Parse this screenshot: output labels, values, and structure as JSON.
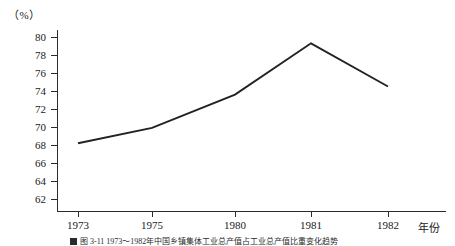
{
  "figure": {
    "unit_label": "（%）",
    "x_axis_name": "年份",
    "caption": "图 3-11  1973～1982年中国乡镇集体工业总产值占工业总产值比重变化趋势"
  },
  "chart_data": {
    "type": "line",
    "title": "",
    "subtitle": "",
    "xlabel": "年份",
    "ylabel": "（%）",
    "categories": [
      "1973",
      "1975",
      "1980",
      "1981",
      "1982"
    ],
    "values": [
      68.2,
      69.9,
      73.6,
      79.3,
      74.5
    ],
    "series": [
      {
        "name": "比重",
        "values": [
          68.2,
          69.9,
          73.6,
          79.3,
          74.5
        ]
      }
    ],
    "ylim": [
      62,
      80
    ],
    "ytick_labels": [
      "80",
      "78",
      "76",
      "74",
      "72",
      "70",
      "68",
      "66",
      "64",
      "62"
    ],
    "ytick_values": [
      80,
      78,
      76,
      74,
      72,
      70,
      68,
      66,
      64,
      62
    ],
    "xtick_labels": [
      "1973",
      "1975",
      "1980",
      "1981",
      "1982"
    ],
    "grid": false,
    "legend": "none",
    "markers": "none",
    "line_color": "#222222"
  }
}
